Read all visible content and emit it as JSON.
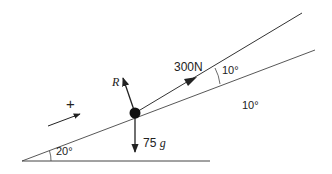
{
  "diagram": {
    "labels": {
      "pull_force": "300N",
      "normal_reaction": "R",
      "weight": "75",
      "weight_g": "g",
      "angle_pull": "10°",
      "angle_pull_repeat": "10°",
      "angle_incline": "20°",
      "positive_direction": "+"
    },
    "colors": {
      "line": "#333333",
      "particle": "#111111",
      "background": "#ffffff"
    }
  }
}
